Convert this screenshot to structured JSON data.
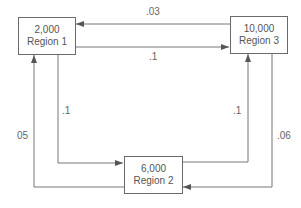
{
  "diagram": {
    "type": "flow-network",
    "nodes": [
      {
        "id": "region1",
        "value": "2,000",
        "name": "Region 1"
      },
      {
        "id": "region2",
        "value": "6,000",
        "name": "Region 2"
      },
      {
        "id": "region3",
        "value": "10,000",
        "name": "Region 3"
      }
    ],
    "edges": [
      {
        "from": "region3",
        "to": "region1",
        "label": ".03"
      },
      {
        "from": "region1",
        "to": "region3",
        "label": ".1"
      },
      {
        "from": "region1",
        "to": "region2",
        "label": ".1"
      },
      {
        "from": "region2",
        "to": "region1",
        "label": "05"
      },
      {
        "from": "region2",
        "to": "region3",
        "label": ".1"
      },
      {
        "from": "region3",
        "to": "region2",
        "label": ".06"
      }
    ],
    "colors": {
      "line": "#6a6a6a",
      "text": "#555555",
      "background": "#ffffff"
    }
  }
}
